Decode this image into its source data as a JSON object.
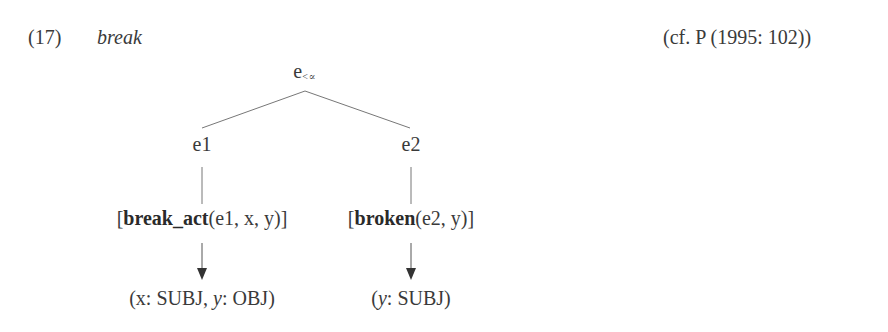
{
  "example": {
    "number": "(17)",
    "word": "break",
    "citation": "(cf. P (1995: 102))"
  },
  "tree": {
    "root": {
      "label": "e",
      "subscript": "<∝"
    },
    "children": [
      {
        "label": "e1",
        "predicate": {
          "open": "[",
          "name": "break_act",
          "args": "(e1, x, y)",
          "close": "]"
        },
        "mapping": {
          "open": "(",
          "v1": "x",
          "r1": ": SUBJ, ",
          "v2": "y",
          "r2": ": OBJ",
          "close": ")"
        }
      },
      {
        "label": "e2",
        "predicate": {
          "open": "[",
          "name": "broken",
          "args": "(e2, y)",
          "close": "]"
        },
        "mapping": {
          "open": "(",
          "v1": "y",
          "r1": ": SUBJ",
          "close": ")"
        }
      }
    ]
  },
  "colors": {
    "text": "#3a3a3a",
    "lines": "#6a6a6a",
    "arrow": "#333333"
  }
}
